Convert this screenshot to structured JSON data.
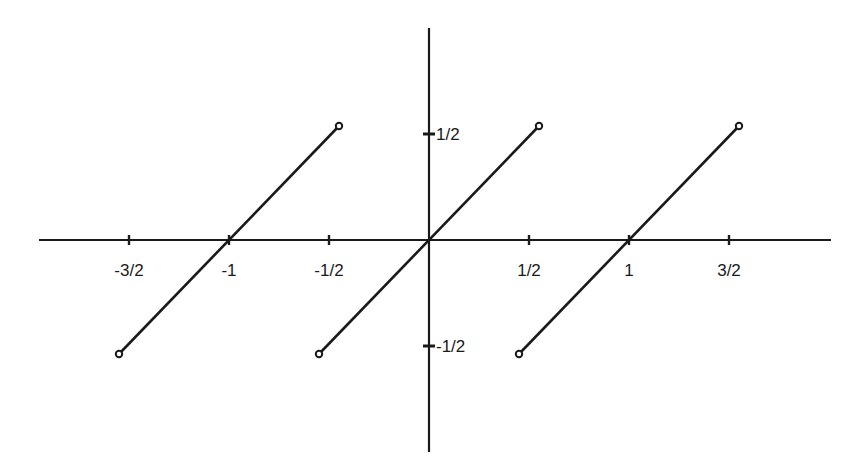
{
  "chart_data": {
    "type": "line",
    "title": "",
    "xlabel": "",
    "ylabel": "",
    "xlim": [
      -1.95,
      2.0
    ],
    "ylim": [
      -1.0,
      1.05
    ],
    "grid": false,
    "legend": null,
    "x_ticks": [
      {
        "value": -1.5,
        "label": "-3/2"
      },
      {
        "value": -1.0,
        "label": "-1"
      },
      {
        "value": -0.5,
        "label": "-1/2"
      },
      {
        "value": 0.5,
        "label": "1/2"
      },
      {
        "value": 1.0,
        "label": "1"
      },
      {
        "value": 1.5,
        "label": "3/2"
      }
    ],
    "y_ticks": [
      {
        "value": 0.5,
        "label": "1/2"
      },
      {
        "value": -0.5,
        "label": "-1/2"
      }
    ],
    "series": [
      {
        "name": "segment-1",
        "x": [
          -1.5,
          -0.5
        ],
        "y": [
          -0.5,
          0.5
        ],
        "endpoints": [
          "open",
          "open"
        ]
      },
      {
        "name": "segment-2",
        "x": [
          -0.5,
          0.5
        ],
        "y": [
          -0.5,
          0.5
        ],
        "endpoints": [
          "open",
          "open"
        ]
      },
      {
        "name": "segment-3",
        "x": [
          0.5,
          1.5
        ],
        "y": [
          -0.5,
          0.5
        ],
        "endpoints": [
          "open",
          "open"
        ]
      }
    ],
    "colors": {
      "line": "#1a1a1a",
      "background": "#ffffff"
    }
  }
}
